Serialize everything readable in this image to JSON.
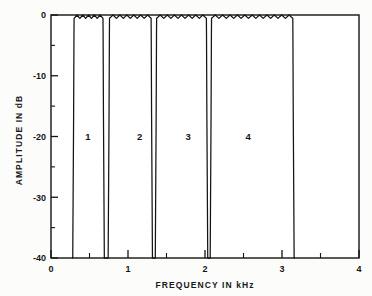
{
  "chart_data": {
    "type": "line",
    "title": "",
    "xlabel": "FREQUENCY IN kHz",
    "ylabel": "AMPLITUDE IN dB",
    "xlim": [
      0,
      4
    ],
    "ylim": [
      -40,
      0
    ],
    "grid": false,
    "legend": null,
    "x_ticks": [
      0,
      1,
      2,
      3,
      4
    ],
    "x_tick_labels": [
      "0",
      "1",
      "2",
      "3",
      "4"
    ],
    "x_minor_ticks": [
      0.5,
      1.5,
      2.5,
      3.5
    ],
    "y_ticks": [
      0,
      -10,
      -20,
      -30,
      -40
    ],
    "y_tick_labels": [
      "0",
      "-10",
      "-20",
      "-30",
      "-40"
    ],
    "y_minor_ticks": [
      -5,
      -15,
      -25,
      -35
    ],
    "annotations": [
      {
        "text": "1",
        "x": 0.48,
        "y": -20.5
      },
      {
        "text": "2",
        "x": 1.15,
        "y": -20.5
      },
      {
        "text": "3",
        "x": 1.78,
        "y": -20.5
      },
      {
        "text": "4",
        "x": 2.56,
        "y": -20.5
      }
    ],
    "series": [
      {
        "name": "multiband filter response",
        "description": "Magnitude response of a four-band filter bank, equiripple passbands at 0 dB with sharp transitions to below -40 dB",
        "passbands": [
          {
            "index": 1,
            "start": 0.3,
            "end": 0.675,
            "ripples": 5
          },
          {
            "index": 2,
            "start": 0.76,
            "end": 1.3,
            "ripples": 6
          },
          {
            "index": 3,
            "start": 1.372,
            "end": 2.018,
            "ripples": 7
          },
          {
            "index": 4,
            "start": 2.085,
            "end": 3.14,
            "ripples": 11
          }
        ],
        "passband_level_db": 0,
        "passband_ripple_db": 0.55,
        "stopband_floor_db": -40,
        "notch_depths_db": [
          -40,
          -40,
          -40
        ],
        "notches": [
          {
            "between": [
              1,
              2
            ],
            "center": 0.717,
            "min_db": -40
          },
          {
            "between": [
              2,
              3
            ],
            "center": 1.337,
            "min_db": -40
          },
          {
            "between": [
              3,
              4
            ],
            "center": 2.052,
            "min_db": -40
          }
        ]
      }
    ]
  },
  "axes": {
    "x_axis_title": "FREQUENCY IN kHz",
    "y_axis_title": "AMPLITUDE IN dB"
  }
}
